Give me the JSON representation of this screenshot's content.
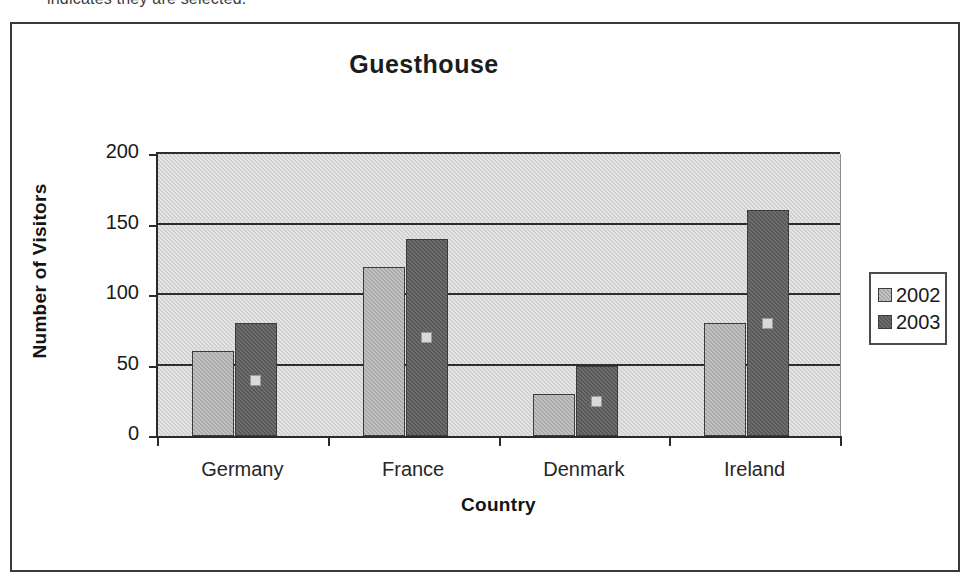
{
  "caption": {
    "clipped_line": "indicates they are selected."
  },
  "chart_data": {
    "type": "bar",
    "title": "Guesthouse",
    "xlabel": "Country",
    "ylabel": "Number of Visitors",
    "categories": [
      "Germany",
      "France",
      "Denmark",
      "Ireland"
    ],
    "series": [
      {
        "name": "2002",
        "color": "#a9a9a9",
        "values": [
          60,
          120,
          30,
          80
        ]
      },
      {
        "name": "2003",
        "color": "#575757",
        "values": [
          80,
          140,
          50,
          160
        ]
      }
    ],
    "ylim": [
      0,
      200
    ],
    "yticks": [
      0,
      50,
      100,
      150,
      200
    ],
    "ytick_labels": [
      "0",
      "50",
      "100",
      "150",
      "200"
    ],
    "grid": true,
    "grid_axis": "y",
    "legend_position": "right",
    "plot_background": "#d0d0d0",
    "selected_series": "2003",
    "selection_handles": true
  },
  "legend": {
    "entries": [
      {
        "label": "2002"
      },
      {
        "label": "2003"
      }
    ]
  }
}
